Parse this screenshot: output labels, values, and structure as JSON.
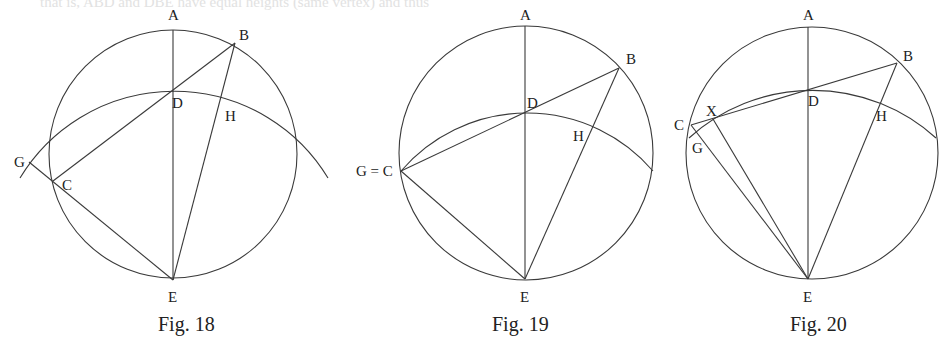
{
  "bleed_text": "that is, ABD and DBE have equal heights (same vertex) and thus",
  "figures": [
    {
      "caption": "Fig. 18",
      "labels": {
        "A": "A",
        "B": "B",
        "C": "C",
        "D": "D",
        "E": "E",
        "G": "G",
        "H": "H"
      }
    },
    {
      "caption": "Fig. 19",
      "labels": {
        "A": "A",
        "B": "B",
        "GC": "G = C",
        "D": "D",
        "E": "E",
        "H": "H"
      }
    },
    {
      "caption": "Fig. 20",
      "labels": {
        "A": "A",
        "B": "B",
        "C": "C",
        "D": "D",
        "E": "E",
        "G": "G",
        "H": "H",
        "X": "X"
      }
    }
  ]
}
